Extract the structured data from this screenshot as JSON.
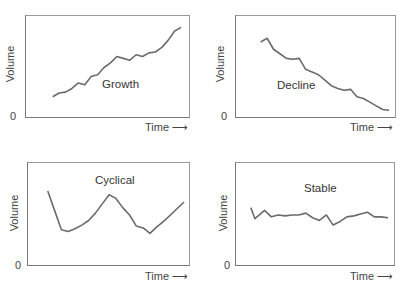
{
  "chart_data": [
    {
      "type": "line",
      "title": "Growth",
      "xlabel": "Time",
      "ylabel": "Volume",
      "y_tick_labels": [
        "0"
      ],
      "x_arrow": true,
      "grid": false,
      "description": "Volume rises steadily over time with small fluctuations",
      "x": [
        0,
        0.05,
        0.1,
        0.15,
        0.2,
        0.25,
        0.3,
        0.35,
        0.4,
        0.45,
        0.5,
        0.55,
        0.6,
        0.65,
        0.7,
        0.75,
        0.8,
        0.85,
        0.9,
        0.95,
        1.0
      ],
      "values": [
        0.18,
        0.22,
        0.23,
        0.27,
        0.33,
        0.31,
        0.4,
        0.42,
        0.5,
        0.55,
        0.62,
        0.6,
        0.58,
        0.64,
        0.62,
        0.66,
        0.67,
        0.72,
        0.8,
        0.9,
        0.94
      ]
    },
    {
      "type": "line",
      "title": "Decline",
      "xlabel": "Time",
      "ylabel": "Volume",
      "y_tick_labels": [
        "0"
      ],
      "x_arrow": true,
      "grid": false,
      "description": "Volume falls steadily over time with small fluctuations",
      "x": [
        0,
        0.05,
        0.1,
        0.15,
        0.2,
        0.25,
        0.3,
        0.35,
        0.4,
        0.45,
        0.5,
        0.55,
        0.6,
        0.65,
        0.7,
        0.75,
        0.8,
        0.85,
        0.9,
        0.95,
        1.0
      ],
      "values": [
        0.78,
        0.82,
        0.7,
        0.65,
        0.6,
        0.59,
        0.6,
        0.48,
        0.45,
        0.42,
        0.36,
        0.3,
        0.27,
        0.25,
        0.26,
        0.18,
        0.16,
        0.12,
        0.08,
        0.04,
        0.03
      ]
    },
    {
      "type": "line",
      "title": "Cyclical",
      "xlabel": "Time",
      "ylabel": "Volume",
      "y_tick_labels": [
        "0"
      ],
      "x_arrow": true,
      "grid": false,
      "description": "Volume oscillates: falls, rises to a peak, falls again, then rises",
      "x": [
        0,
        0.05,
        0.1,
        0.15,
        0.2,
        0.25,
        0.3,
        0.35,
        0.4,
        0.45,
        0.5,
        0.55,
        0.6,
        0.65,
        0.7,
        0.75,
        0.8,
        0.85,
        0.9,
        0.95,
        1.0
      ],
      "values": [
        0.76,
        0.55,
        0.34,
        0.32,
        0.35,
        0.39,
        0.44,
        0.52,
        0.62,
        0.72,
        0.68,
        0.58,
        0.5,
        0.38,
        0.36,
        0.3,
        0.37,
        0.43,
        0.5,
        0.57,
        0.64
      ]
    },
    {
      "type": "line",
      "title": "Stable",
      "xlabel": "Time",
      "ylabel": "Volume",
      "y_tick_labels": [
        "0"
      ],
      "x_arrow": true,
      "grid": false,
      "description": "Volume stays roughly constant with minor fluctuations",
      "x": [
        0,
        0.03,
        0.1,
        0.15,
        0.2,
        0.25,
        0.3,
        0.35,
        0.4,
        0.45,
        0.5,
        0.55,
        0.6,
        0.65,
        0.7,
        0.75,
        0.8,
        0.85,
        0.9,
        0.95,
        1.0
      ],
      "values": [
        0.58,
        0.46,
        0.55,
        0.48,
        0.5,
        0.49,
        0.5,
        0.5,
        0.52,
        0.47,
        0.44,
        0.5,
        0.39,
        0.43,
        0.48,
        0.49,
        0.51,
        0.53,
        0.48,
        0.48,
        0.47
      ]
    }
  ],
  "panels": [
    {
      "title": "Growth",
      "ylabel": "Volume",
      "zero": "0",
      "xlabel": "Time",
      "arrow": "⟶"
    },
    {
      "title": "Decline",
      "ylabel": "Volume",
      "zero": "0",
      "xlabel": "Time",
      "arrow": "⟶"
    },
    {
      "title": "Cyclical",
      "ylabel": "Volume",
      "zero": "0",
      "xlabel": "Time",
      "arrow": "⟶"
    },
    {
      "title": "Stable",
      "ylabel": "Volume",
      "zero": "0",
      "xlabel": "Time",
      "arrow": "⟶"
    }
  ],
  "colors": {
    "line": "#6b6b6b",
    "axis": "#777777",
    "text": "#444444"
  }
}
